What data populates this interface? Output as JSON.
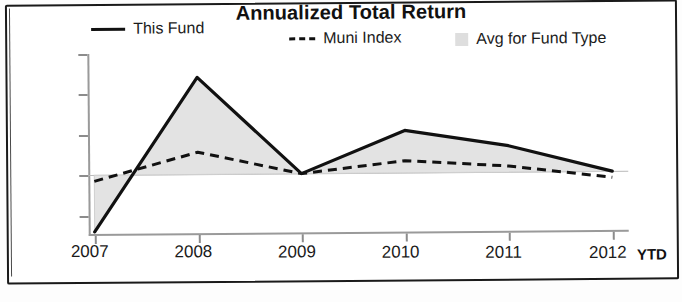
{
  "chart_data": {
    "type": "line",
    "title": "Annualized Total Return",
    "xlabel": "",
    "ylabel": "",
    "categories": [
      "2007",
      "2008",
      "2009",
      "2010",
      "2011",
      "2012"
    ],
    "x_axis_note": "YTD",
    "ylim": [
      -30,
      60
    ],
    "yticks": [
      60,
      40,
      20,
      0,
      -20
    ],
    "ytick_labels": [
      "60%",
      "40%",
      "20%",
      "0%",
      "-20%"
    ],
    "grid": false,
    "legend_position": "top",
    "series": [
      {
        "name": "This Fund",
        "style": "solid-line",
        "color": "#111111",
        "values": [
          -28,
          48,
          0,
          21,
          13,
          0
        ]
      },
      {
        "name": "Muni Index",
        "style": "dashed-line",
        "color": "#111111",
        "values": [
          -3,
          11,
          0,
          6,
          3,
          -3
        ]
      },
      {
        "name": "Avg for Fund Type",
        "style": "shaded-area",
        "color": "#e2e2e2",
        "values": [
          -14,
          24,
          0,
          11,
          7,
          -2
        ]
      }
    ]
  },
  "legend": {
    "items": [
      {
        "label": "This Fund",
        "marker": "solid-line-swatch"
      },
      {
        "label": "Muni Index",
        "marker": "dashed-line-swatch"
      },
      {
        "label": "Avg for Fund Type",
        "marker": "gray-box-swatch"
      }
    ]
  },
  "axes": {
    "y_labels": [
      "60%",
      "40%",
      "20%",
      "0%",
      "-20%"
    ],
    "x_labels": [
      "2007",
      "2008",
      "2009",
      "2010",
      "2011",
      "2012"
    ],
    "x_suffix": "YTD"
  },
  "colors": {
    "line": "#111111",
    "area_fill": "#e2e2e2",
    "axis": "#9a9a9a",
    "frame": "#1a1a1a"
  }
}
